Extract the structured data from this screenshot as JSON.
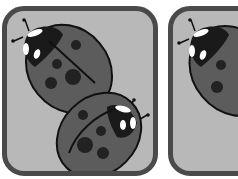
{
  "cards": [
    {
      "id": "card-1",
      "content": "two ladybugs",
      "count": 2
    },
    {
      "id": "card-2",
      "content": "ladybug (partially visible)",
      "count": 1
    }
  ],
  "colors": {
    "card_bg": "#b8b8b8",
    "card_border": "#4a4a4a",
    "shell": "#5c5c5c",
    "head": "#1a1a1a",
    "spots": "#222222",
    "highlights": "#ffffff"
  }
}
